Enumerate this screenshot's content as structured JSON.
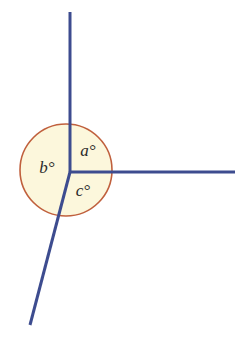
{
  "diagram": {
    "canvas": {
      "width": 244,
      "height": 340,
      "background": "#ffffff"
    },
    "colors": {
      "ray": "#3d4c8f",
      "arc_stroke": "#c0603d",
      "arc_fill": "#fcf7dc",
      "label_text": "#2b2b2b"
    },
    "vertex": {
      "x": 70,
      "y": 172
    },
    "circle": {
      "cx": 66,
      "cy": 170,
      "r": 46
    },
    "rays": [
      {
        "name": "ray-up",
        "x1": 70,
        "y1": 172,
        "x2": 70,
        "y2": 12,
        "width": 3
      },
      {
        "name": "ray-right",
        "x1": 70,
        "y1": 172,
        "x2": 235,
        "y2": 172,
        "width": 3
      },
      {
        "name": "ray-down-left",
        "x1": 70,
        "y1": 172,
        "x2": 30,
        "y2": 325,
        "width": 3
      }
    ],
    "labels": [
      {
        "id": "a",
        "text": "a°",
        "x": 88,
        "y": 152
      },
      {
        "id": "b",
        "text": "b°",
        "x": 47,
        "y": 169
      },
      {
        "id": "c",
        "text": "c°",
        "x": 83,
        "y": 192
      }
    ]
  }
}
